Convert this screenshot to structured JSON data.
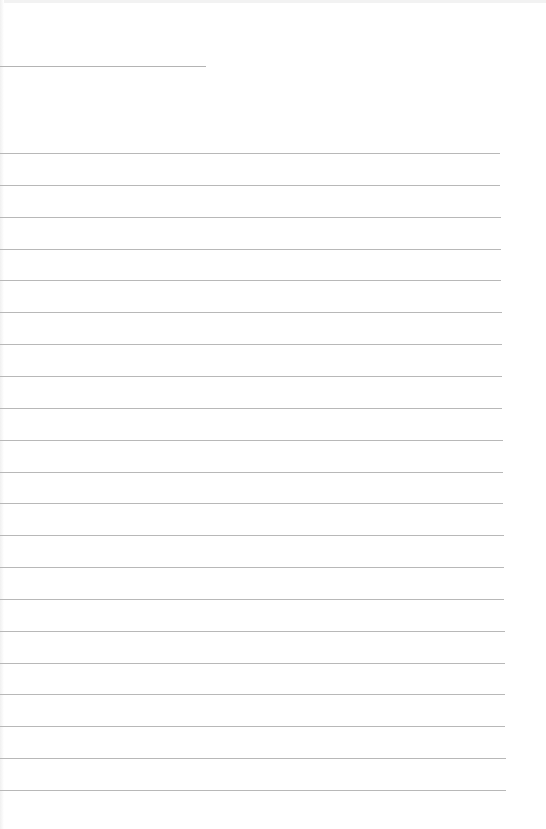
{
  "page": {
    "type": "lined-paper",
    "background": "#ffffff",
    "line_color": "#b8b8b8",
    "header_line": {
      "top": 66,
      "width": 206
    },
    "rules": {
      "count": 21,
      "first_top": 153,
      "spacing": 31.85,
      "start_width": 500,
      "end_width": 506
    }
  }
}
